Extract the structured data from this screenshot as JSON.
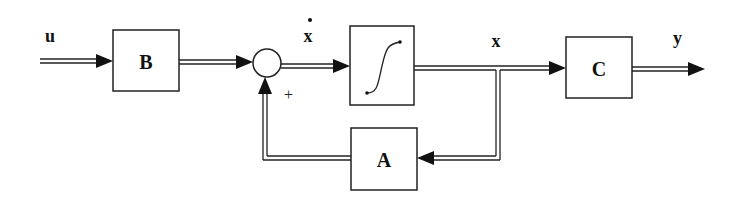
{
  "diagram": {
    "type": "state-space block diagram",
    "signals": {
      "input": "u",
      "state_derivative": "x",
      "state_derivative_dot": "•",
      "state": "x",
      "output": "y"
    },
    "blocks": {
      "input_matrix": "B",
      "integrator": "∫",
      "output_matrix": "C",
      "system_matrix": "A"
    },
    "summing_junction": {
      "feedback_sign": "+"
    },
    "colors": {
      "stroke": "#222222",
      "background": "#ffffff"
    }
  }
}
